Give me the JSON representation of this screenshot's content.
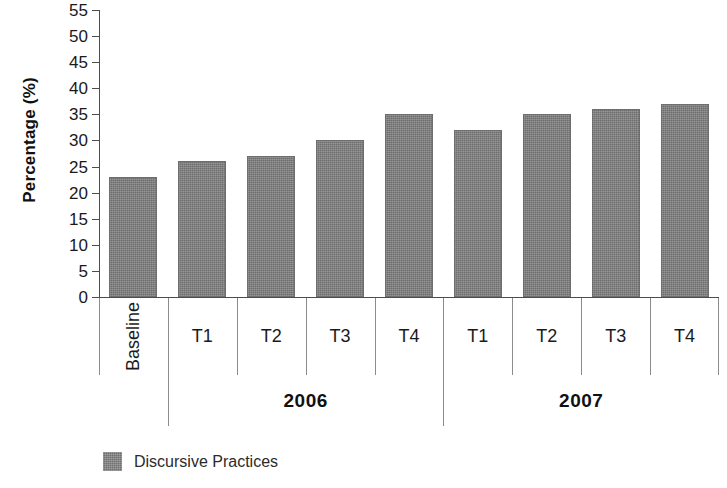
{
  "chart_data": {
    "type": "bar",
    "title": "",
    "xlabel": "",
    "ylabel": "Percentage (%)",
    "ylim": [
      0,
      55
    ],
    "ytick_step": 5,
    "yticks": [
      0,
      5,
      10,
      15,
      20,
      25,
      30,
      35,
      40,
      45,
      50,
      55
    ],
    "grid": false,
    "legend_position": "bottom-left",
    "categories": [
      "Baseline",
      "T1",
      "T2",
      "T3",
      "T4",
      "T1",
      "T2",
      "T3",
      "T4"
    ],
    "group_labels": [
      "",
      "2006",
      "2006",
      "2006",
      "2006",
      "2007",
      "2007",
      "2007",
      "2007"
    ],
    "groups": [
      {
        "label": "",
        "span": 1
      },
      {
        "label": "2006",
        "span": 4
      },
      {
        "label": "2007",
        "span": 4
      }
    ],
    "series": [
      {
        "name": "Discursive Practices",
        "color": "#7d7d7d",
        "values": [
          23,
          26,
          27,
          30,
          35,
          32,
          35,
          36,
          37
        ]
      }
    ]
  },
  "legend": {
    "items": [
      {
        "label": "Discursive Practices",
        "color": "#7d7d7d"
      }
    ]
  },
  "colors": {
    "bar": "#7d7d7d",
    "axis": "#4d4d4d",
    "separator": "#8c8c8c",
    "text": "#1a1a1a",
    "background": "#ffffff"
  }
}
